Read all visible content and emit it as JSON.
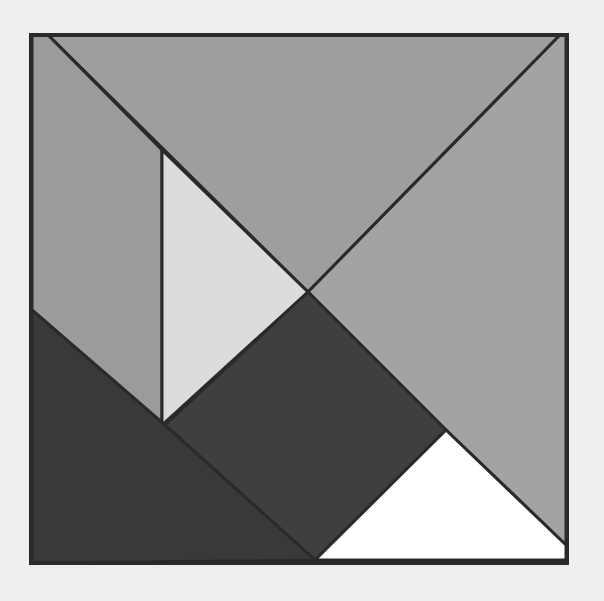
{
  "diagram": {
    "type": "tangram",
    "background": "#efefef",
    "outline_color": "#2a2a2a",
    "pieces": [
      {
        "name": "large-triangle-top",
        "fill": "#9e9e9e",
        "points": "48,35 560,35 308,292"
      },
      {
        "name": "large-triangle-right",
        "fill": "#a3a3a3",
        "points": "560,35 566,35 566,545 446,430 308,292"
      },
      {
        "name": "parallelogram-left",
        "fill": "#9b9b9b",
        "points": "32,35 48,35 162,150 162,425 32,310"
      },
      {
        "name": "small-triangle-light",
        "fill": "#dcdcdc",
        "points": "162,150 308,292 162,425"
      },
      {
        "name": "square-dark",
        "fill": "#3f3f3f",
        "points": "308,292 446,430 315,560 165,425"
      },
      {
        "name": "large-triangle-bottom-left",
        "fill": "#393939",
        "points": "32,310 165,425 315,560 32,563"
      },
      {
        "name": "small-triangle-white",
        "fill": "#ffffff",
        "points": "446,430 566,545 566,560 315,560"
      }
    ]
  }
}
